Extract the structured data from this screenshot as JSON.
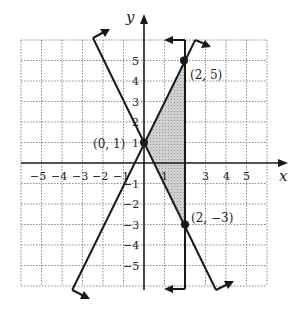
{
  "figure": {
    "axis_labels": {
      "x": "x",
      "y": "y"
    },
    "x_ticks": [
      "-5",
      "-4",
      "-3",
      "-2",
      "-1",
      "1",
      "3",
      "4",
      "5"
    ],
    "y_ticks": [
      "5",
      "4",
      "3",
      "2",
      "1",
      "-1",
      "-2",
      "-3",
      "-4",
      "-5"
    ],
    "grid_range": {
      "x": [
        -6,
        6
      ],
      "y": [
        -6,
        6
      ]
    },
    "lines": [
      {
        "name": "line-y-eq-2x-plus-1",
        "equation": "y = 2x + 1",
        "boundary": "solid"
      },
      {
        "name": "line-y-eq-neg2x-plus-1",
        "equation": "y = -2x + 1",
        "boundary": "solid"
      },
      {
        "name": "line-x-eq-2",
        "equation": "x = 2",
        "boundary": "solid"
      }
    ],
    "points": [
      {
        "label": "(0, 1)",
        "x": 0,
        "y": 1
      },
      {
        "label": "(2, 5)",
        "x": 2,
        "y": 5
      },
      {
        "label": "(2, −3)",
        "x": 2,
        "y": -3
      }
    ],
    "shaded_region": "triangle with vertices (0,1), (2,5), (2,-3)",
    "colors": {
      "line": "#1a1a1a",
      "grid": "#888888",
      "shade": "#bdbdbd"
    }
  }
}
